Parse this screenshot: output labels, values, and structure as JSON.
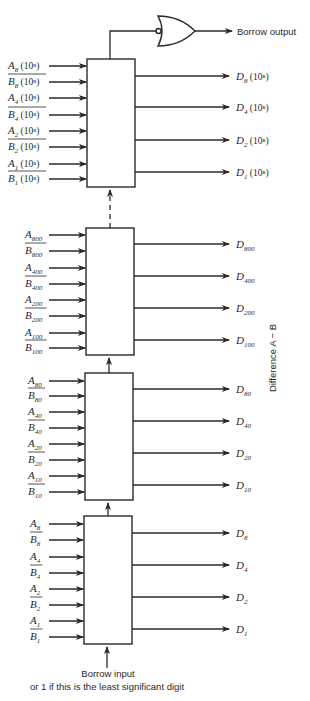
{
  "gate": {
    "type": "NOR (inverted-input OR)",
    "output_label": "Borrow output"
  },
  "side_label": "Difference A − B",
  "bottom": {
    "line1": "Borrow input",
    "line2": "or 1 if this is the least significant digit"
  },
  "stages": [
    {
      "name": "digit-n",
      "inputs": [
        {
          "letter": "A",
          "sub": "8",
          "suffix": " (10ⁿ)",
          "bar": false
        },
        {
          "letter": "B",
          "sub": "8",
          "suffix": " (10ⁿ)",
          "bar": true
        },
        {
          "letter": "A",
          "sub": "4",
          "suffix": " (10ⁿ)",
          "bar": false
        },
        {
          "letter": "B",
          "sub": "4",
          "suffix": " (10ⁿ)",
          "bar": true
        },
        {
          "letter": "A",
          "sub": "2",
          "suffix": " (10ⁿ)",
          "bar": false
        },
        {
          "letter": "B",
          "sub": "2",
          "suffix": " (10ⁿ)",
          "bar": true
        },
        {
          "letter": "A",
          "sub": "1",
          "suffix": " (10ⁿ)",
          "bar": false
        },
        {
          "letter": "B",
          "sub": "1",
          "suffix": " (10ⁿ)",
          "bar": true
        }
      ],
      "outputs": [
        {
          "letter": "D",
          "sub": "8",
          "suffix": " (10ⁿ)"
        },
        {
          "letter": "D",
          "sub": "4",
          "suffix": " (10ⁿ)"
        },
        {
          "letter": "D",
          "sub": "2",
          "suffix": " (10ⁿ)"
        },
        {
          "letter": "D",
          "sub": "1",
          "suffix": " (10ⁿ)"
        }
      ]
    },
    {
      "name": "hundreds",
      "inputs": [
        {
          "letter": "A",
          "sub": "800",
          "suffix": "",
          "bar": false
        },
        {
          "letter": "B",
          "sub": "800",
          "suffix": "",
          "bar": true
        },
        {
          "letter": "A",
          "sub": "400",
          "suffix": "",
          "bar": false
        },
        {
          "letter": "B",
          "sub": "400",
          "suffix": "",
          "bar": true
        },
        {
          "letter": "A",
          "sub": "200",
          "suffix": "",
          "bar": false
        },
        {
          "letter": "B",
          "sub": "200",
          "suffix": "",
          "bar": true
        },
        {
          "letter": "A",
          "sub": "100",
          "suffix": "",
          "bar": false
        },
        {
          "letter": "B",
          "sub": "100",
          "suffix": "",
          "bar": true
        }
      ],
      "outputs": [
        {
          "letter": "D",
          "sub": "800",
          "suffix": ""
        },
        {
          "letter": "D",
          "sub": "400",
          "suffix": ""
        },
        {
          "letter": "D",
          "sub": "200",
          "suffix": ""
        },
        {
          "letter": "D",
          "sub": "100",
          "suffix": ""
        }
      ]
    },
    {
      "name": "tens",
      "inputs": [
        {
          "letter": "A",
          "sub": "80",
          "suffix": "",
          "bar": false
        },
        {
          "letter": "B",
          "sub": "80",
          "suffix": "",
          "bar": true
        },
        {
          "letter": "A",
          "sub": "40",
          "suffix": "",
          "bar": false
        },
        {
          "letter": "B",
          "sub": "40",
          "suffix": "",
          "bar": true
        },
        {
          "letter": "A",
          "sub": "20",
          "suffix": "",
          "bar": false
        },
        {
          "letter": "B",
          "sub": "20",
          "suffix": "",
          "bar": true
        },
        {
          "letter": "A",
          "sub": "10",
          "suffix": "",
          "bar": false
        },
        {
          "letter": "B",
          "sub": "10",
          "suffix": "",
          "bar": true
        }
      ],
      "outputs": [
        {
          "letter": "D",
          "sub": "80",
          "suffix": ""
        },
        {
          "letter": "D",
          "sub": "40",
          "suffix": ""
        },
        {
          "letter": "D",
          "sub": "20",
          "suffix": ""
        },
        {
          "letter": "D",
          "sub": "10",
          "suffix": ""
        }
      ]
    },
    {
      "name": "units",
      "inputs": [
        {
          "letter": "A",
          "sub": "8",
          "suffix": "",
          "bar": false
        },
        {
          "letter": "B",
          "sub": "8",
          "suffix": "",
          "bar": true
        },
        {
          "letter": "A",
          "sub": "4",
          "suffix": "",
          "bar": false
        },
        {
          "letter": "B",
          "sub": "4",
          "suffix": "",
          "bar": true
        },
        {
          "letter": "A",
          "sub": "2",
          "suffix": "",
          "bar": false
        },
        {
          "letter": "B",
          "sub": "2",
          "suffix": "",
          "bar": true
        },
        {
          "letter": "A",
          "sub": "1",
          "suffix": "",
          "bar": false
        },
        {
          "letter": "B",
          "sub": "1",
          "suffix": "",
          "bar": true
        }
      ],
      "outputs": [
        {
          "letter": "D",
          "sub": "8",
          "suffix": ""
        },
        {
          "letter": "D",
          "sub": "4",
          "suffix": ""
        },
        {
          "letter": "D",
          "sub": "2",
          "suffix": ""
        },
        {
          "letter": "D",
          "sub": "1",
          "suffix": ""
        }
      ]
    }
  ]
}
